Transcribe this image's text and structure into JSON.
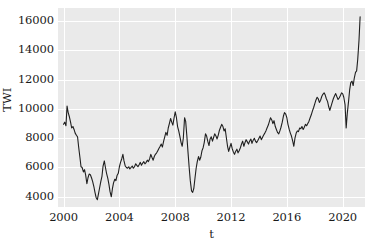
{
  "chart_data": {
    "type": "line",
    "title": "",
    "xlabel": "t",
    "ylabel": "TWI",
    "xlim": [
      1999.6,
      2021.6
    ],
    "ylim": [
      3300,
      16900
    ],
    "xticks": [
      2000,
      2004,
      2008,
      2012,
      2016,
      2020
    ],
    "xtick_labels": [
      "2000",
      "2004",
      "2008",
      "2012",
      "2016",
      "2020"
    ],
    "yticks": [
      4000,
      6000,
      8000,
      10000,
      12000,
      14000,
      16000
    ],
    "ytick_labels": [
      "4000",
      "6000",
      "8000",
      "10000",
      "12000",
      "14000",
      "16000"
    ],
    "grid": true,
    "legend": false,
    "line_color": "#1f1f1f",
    "line_width": 1.1,
    "plot_bg": "#eaeaea",
    "grid_color": "#ffffff",
    "series": [
      {
        "name": "TWI",
        "x": [
          2000.0,
          2000.08,
          2000.17,
          2000.25,
          2000.33,
          2000.42,
          2000.5,
          2000.58,
          2000.67,
          2000.75,
          2000.83,
          2000.92,
          2001.0,
          2001.08,
          2001.17,
          2001.25,
          2001.33,
          2001.42,
          2001.5,
          2001.58,
          2001.67,
          2001.75,
          2001.83,
          2001.92,
          2002.0,
          2002.08,
          2002.17,
          2002.25,
          2002.33,
          2002.42,
          2002.5,
          2002.58,
          2002.67,
          2002.75,
          2002.83,
          2002.92,
          2003.0,
          2003.08,
          2003.17,
          2003.25,
          2003.33,
          2003.42,
          2003.5,
          2003.58,
          2003.67,
          2003.75,
          2003.83,
          2003.92,
          2004.0,
          2004.08,
          2004.17,
          2004.25,
          2004.33,
          2004.42,
          2004.5,
          2004.58,
          2004.67,
          2004.75,
          2004.83,
          2004.92,
          2005.0,
          2005.08,
          2005.17,
          2005.25,
          2005.33,
          2005.42,
          2005.5,
          2005.58,
          2005.67,
          2005.75,
          2005.83,
          2005.92,
          2006.0,
          2006.08,
          2006.17,
          2006.25,
          2006.33,
          2006.42,
          2006.5,
          2006.58,
          2006.67,
          2006.75,
          2006.83,
          2006.92,
          2007.0,
          2007.08,
          2007.17,
          2007.25,
          2007.33,
          2007.42,
          2007.5,
          2007.58,
          2007.67,
          2007.75,
          2007.83,
          2007.92,
          2008.0,
          2008.08,
          2008.17,
          2008.25,
          2008.33,
          2008.42,
          2008.5,
          2008.58,
          2008.67,
          2008.75,
          2008.83,
          2008.92,
          2009.0,
          2009.08,
          2009.17,
          2009.25,
          2009.33,
          2009.42,
          2009.5,
          2009.58,
          2009.67,
          2009.75,
          2009.83,
          2009.92,
          2010.0,
          2010.08,
          2010.17,
          2010.25,
          2010.33,
          2010.42,
          2010.5,
          2010.58,
          2010.67,
          2010.75,
          2010.83,
          2010.92,
          2011.0,
          2011.08,
          2011.17,
          2011.25,
          2011.33,
          2011.42,
          2011.5,
          2011.58,
          2011.67,
          2011.75,
          2011.83,
          2011.92,
          2012.0,
          2012.08,
          2012.17,
          2012.25,
          2012.33,
          2012.42,
          2012.5,
          2012.58,
          2012.67,
          2012.75,
          2012.83,
          2012.92,
          2013.0,
          2013.08,
          2013.17,
          2013.25,
          2013.33,
          2013.42,
          2013.5,
          2013.58,
          2013.67,
          2013.75,
          2013.83,
          2013.92,
          2014.0,
          2014.08,
          2014.17,
          2014.25,
          2014.33,
          2014.42,
          2014.5,
          2014.58,
          2014.67,
          2014.75,
          2014.83,
          2014.92,
          2015.0,
          2015.08,
          2015.17,
          2015.25,
          2015.33,
          2015.42,
          2015.5,
          2015.58,
          2015.67,
          2015.75,
          2015.83,
          2015.92,
          2016.0,
          2016.08,
          2016.17,
          2016.25,
          2016.33,
          2016.42,
          2016.5,
          2016.58,
          2016.67,
          2016.75,
          2016.83,
          2016.92,
          2017.0,
          2017.08,
          2017.17,
          2017.25,
          2017.33,
          2017.42,
          2017.5,
          2017.58,
          2017.67,
          2017.75,
          2017.83,
          2017.92,
          2018.0,
          2018.08,
          2018.17,
          2018.25,
          2018.33,
          2018.42,
          2018.5,
          2018.58,
          2018.67,
          2018.75,
          2018.83,
          2018.92,
          2019.0,
          2019.08,
          2019.17,
          2019.25,
          2019.33,
          2019.42,
          2019.5,
          2019.58,
          2019.67,
          2019.75,
          2019.83,
          2019.92,
          2020.0,
          2020.08,
          2020.17,
          2020.25,
          2020.33,
          2020.42,
          2020.5,
          2020.58,
          2020.67,
          2020.75,
          2020.83,
          2020.92,
          2021.0,
          2021.08,
          2021.17,
          2021.25
        ],
        "values": [
          8950,
          9100,
          8850,
          10200,
          9750,
          9450,
          9100,
          8700,
          8800,
          8600,
          8350,
          8200,
          8100,
          7400,
          6700,
          6050,
          6000,
          5700,
          5850,
          5500,
          4900,
          5300,
          5550,
          5500,
          5300,
          5050,
          4700,
          4300,
          3950,
          3800,
          4200,
          4600,
          5050,
          5400,
          6100,
          6450,
          6000,
          5600,
          5250,
          4850,
          4350,
          4000,
          4550,
          4950,
          5200,
          5100,
          5450,
          5600,
          6050,
          6350,
          6600,
          6900,
          6450,
          6100,
          6000,
          5950,
          6050,
          5900,
          6000,
          6100,
          5950,
          6050,
          6250,
          6150,
          6050,
          6200,
          6350,
          6150,
          6300,
          6400,
          6250,
          6350,
          6500,
          6400,
          6600,
          6900,
          6700,
          6500,
          6750,
          6900,
          7000,
          7150,
          7300,
          7450,
          7600,
          7400,
          7800,
          8100,
          8400,
          8200,
          8700,
          9000,
          9350,
          9100,
          8900,
          9400,
          9800,
          9450,
          8800,
          8500,
          8150,
          7700,
          7450,
          8000,
          9400,
          9150,
          8200,
          7000,
          6000,
          5100,
          4400,
          4300,
          4550,
          5300,
          5950,
          6400,
          6750,
          6500,
          6700,
          7150,
          7350,
          7700,
          8300,
          8150,
          7800,
          7500,
          7950,
          8100,
          7800,
          8050,
          8300,
          8150,
          7950,
          8200,
          8550,
          8750,
          8950,
          8800,
          8500,
          8650,
          8000,
          7450,
          7100,
          7400,
          7650,
          7300,
          7050,
          6900,
          7100,
          7250,
          7000,
          7150,
          7350,
          7600,
          7800,
          7450,
          7700,
          7900,
          7750,
          7600,
          7800,
          7950,
          7650,
          7850,
          8000,
          7800,
          7700,
          7850,
          8000,
          8150,
          7900,
          8050,
          8200,
          8350,
          8500,
          8700,
          8900,
          9150,
          9400,
          9250,
          9000,
          9200,
          8800,
          8600,
          8400,
          8300,
          8500,
          8750,
          9100,
          9500,
          9750,
          9650,
          9400,
          8950,
          8600,
          8350,
          8150,
          7800,
          7450,
          8000,
          8350,
          8500,
          8450,
          8700,
          8650,
          8800,
          8600,
          8750,
          8950,
          8850,
          9000,
          9150,
          9400,
          9600,
          9850,
          10100,
          10350,
          10600,
          10800,
          10700,
          10450,
          10600,
          10850,
          11000,
          11100,
          10950,
          10700,
          10500,
          10150,
          9900,
          10200,
          10450,
          10700,
          10900,
          11050,
          10850,
          10650,
          10750,
          10900,
          11100,
          11050,
          10800,
          10300,
          8700,
          9700,
          10500,
          11300,
          11800,
          11900,
          11600,
          12100,
          12500,
          12600,
          13400,
          14700,
          16300
        ]
      }
    ]
  },
  "axis": {
    "ylabel": "TWI",
    "xlabel": "t"
  }
}
